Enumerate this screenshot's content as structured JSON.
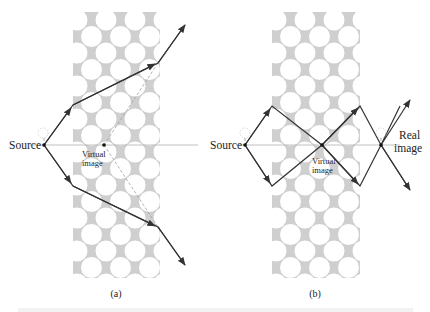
{
  "figure": {
    "colors": {
      "slab": "#cfcfcf",
      "hole": "#ffffff",
      "ray": "#333333",
      "axis": "#b0b0b0",
      "dashed": "#a0a0a0",
      "point": "#111111",
      "glow": "#b5b5b5"
    },
    "panels": [
      {
        "id": "a",
        "label": "(a)",
        "source_label": "Source",
        "image_label_line1": "Virtual",
        "image_label_line2": "image",
        "image_type": "virtual"
      },
      {
        "id": "b",
        "label": "(b)",
        "source_label": "Source",
        "virtual_label_line1": "Virtual",
        "virtual_label_line2": "image",
        "real_label_line1": "Real",
        "real_label_line2": "image",
        "image_type": "real"
      }
    ],
    "caption_partial": "(caption text cut off at bottom edge)"
  }
}
